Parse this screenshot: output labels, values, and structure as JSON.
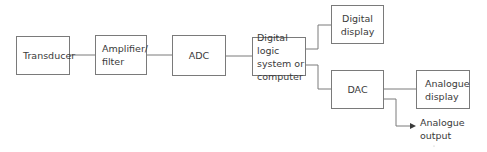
{
  "diagram": {
    "colors": {
      "line": "#7a7a7a",
      "text": "#3a3a3a",
      "background": "#ffffff"
    },
    "blocks": [
      {
        "id": "transducer",
        "label": "Transducer"
      },
      {
        "id": "amplifier",
        "label": "Amplifier/\nfilter"
      },
      {
        "id": "adc",
        "label": "ADC"
      },
      {
        "id": "digital_logic",
        "label": "Digital logic\nsystem or\ncomputer"
      },
      {
        "id": "digital_display",
        "label": "Digital\ndisplay"
      },
      {
        "id": "dac",
        "label": "DAC"
      },
      {
        "id": "analogue_display",
        "label": "Analogue\ndisplay"
      }
    ],
    "output_label": "Analogue\noutput",
    "connections": [
      {
        "from": "transducer",
        "to": "amplifier"
      },
      {
        "from": "amplifier",
        "to": "adc"
      },
      {
        "from": "adc",
        "to": "digital_logic"
      },
      {
        "from": "digital_logic",
        "to": "digital_display"
      },
      {
        "from": "digital_logic",
        "to": "dac"
      },
      {
        "from": "dac",
        "to": "analogue_display"
      },
      {
        "from": "dac",
        "to": "analogue_output",
        "arrow": true
      }
    ]
  }
}
